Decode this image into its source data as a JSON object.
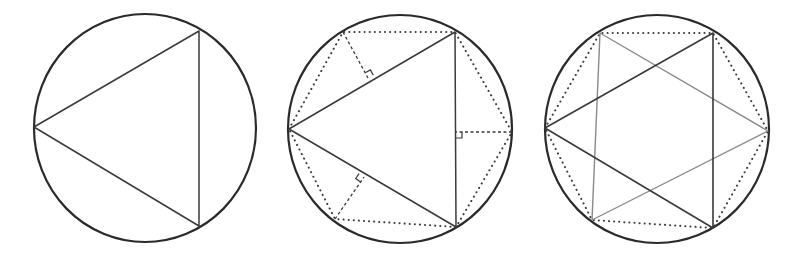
{
  "figure": {
    "colors": {
      "circle": "#2a2a2a",
      "triangle_dark": "#3a3a3a",
      "triangle_light": "#8a8a8a",
      "hexagon_dotted": "#3a3a3a",
      "perpendicular_dashed": "#3a3a3a",
      "right_angle_mark": "#3a3a3a"
    },
    "panels": [
      {
        "id": "panel-1",
        "label": "Inscribed equilateral triangle",
        "circle": {
          "cx": 145,
          "cy": 128,
          "rx": 111,
          "ry": 114
        },
        "triangle": [
          [
            34,
            127
          ],
          [
            199,
            31
          ],
          [
            199,
            226
          ]
        ]
      },
      {
        "id": "panel-2",
        "label": "Perpendicular bisectors locate the hexagon vertices",
        "circle": {
          "cx": 400,
          "cy": 129,
          "rx": 112,
          "ry": 114
        },
        "triangle": [
          [
            289,
            129
          ],
          [
            455,
            32
          ],
          [
            456,
            227
          ]
        ],
        "hexagon": [
          [
            289,
            129
          ],
          [
            343,
            32
          ],
          [
            455,
            32
          ],
          [
            512,
            132
          ],
          [
            456,
            227
          ],
          [
            335,
            219
          ]
        ],
        "perpendiculars": [
          {
            "from": [
              343,
              32
            ],
            "to": [
              368,
              78
            ]
          },
          {
            "from": [
              512,
              132
            ],
            "to": [
              456,
              132
            ]
          },
          {
            "from": [
              335,
              219
            ],
            "to": [
              364,
              177
            ]
          }
        ]
      },
      {
        "id": "panel-3",
        "label": "Hexagon with both inscribed triangles forming a hexagram",
        "circle": {
          "cx": 657,
          "cy": 129,
          "rx": 112,
          "ry": 114
        },
        "triangle_dark": [
          [
            545,
            128
          ],
          [
            713,
            33
          ],
          [
            713,
            228
          ]
        ],
        "triangle_light": [
          [
            600,
            33
          ],
          [
            768,
            131
          ],
          [
            592,
            220
          ]
        ],
        "hexagon": [
          [
            545,
            128
          ],
          [
            600,
            33
          ],
          [
            713,
            33
          ],
          [
            768,
            131
          ],
          [
            713,
            228
          ],
          [
            592,
            220
          ]
        ]
      }
    ]
  }
}
